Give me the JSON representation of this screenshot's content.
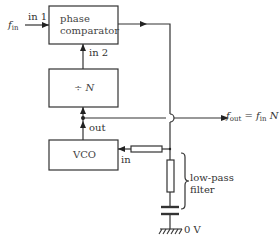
{
  "diagram": {
    "type": "block-diagram",
    "title": "",
    "blocks": [
      {
        "id": "phase_comparator",
        "label_line1": "phase",
        "label_line2": "comparator"
      },
      {
        "id": "divider",
        "label": "÷ N"
      },
      {
        "id": "vco",
        "label": "VCO"
      }
    ],
    "ports": {
      "in1": "in 1",
      "in2": "in 2",
      "out": "out",
      "vco_in": "in"
    },
    "signals": {
      "input_f": "f",
      "input_sub": "in",
      "output_f": "f",
      "output_sub": "out",
      "output_eq": " = ",
      "output_f2": "f",
      "output_sub2": "in",
      "output_N": "N"
    },
    "filter": {
      "label_line1": "low-pass",
      "label_line2": "filter"
    },
    "ground": {
      "label": "0 V"
    },
    "edges": [
      {
        "from": "f_in",
        "to": "phase_comparator.in1"
      },
      {
        "from": "divider",
        "to": "phase_comparator.in2"
      },
      {
        "from": "vco.out",
        "to": "divider"
      },
      {
        "from": "vco.out",
        "to": "f_out"
      },
      {
        "from": "phase_comparator",
        "to": "low_pass_filter"
      },
      {
        "from": "low_pass_filter",
        "to": "vco.in"
      }
    ],
    "colors": {
      "line": "#333333",
      "background": "#ffffff"
    }
  }
}
